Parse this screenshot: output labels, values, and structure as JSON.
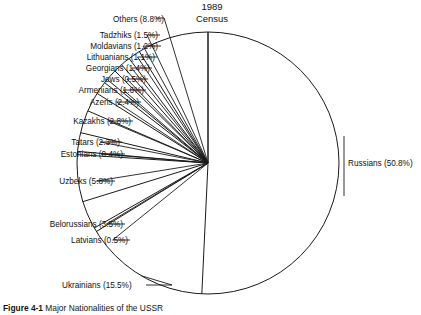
{
  "figure": {
    "title_line1": "1989",
    "title_line2": "Census",
    "caption_number": "Figure 4-1",
    "caption_text": "Major Nationalities of the USSR",
    "background_color": "#ffffff",
    "line_color": "#1a1a1a",
    "text_color": "#111111"
  },
  "labels": {
    "russians": "Russians (50.8%)",
    "ukrainians": "Ukrainians (15.5%)",
    "latvians": "Latvians (0.5%)",
    "belorussians": "Belorussians (3.5%)",
    "uzbeks": "Uzbeks (5.8%)",
    "estonians": "Estonians (0.4%)",
    "tatars": "Tatars (2.3%)",
    "kazakhs": "Kazakhs (2.8%)",
    "azeris": "Azeris (2.4%)",
    "armenians": "Armenians (1.6%)",
    "jews": "Jews (0.5%)",
    "georgians": "Georgians (1.4%)",
    "lithuanians": "Lithuanians (1.1%)",
    "moldavians": "Moldavians (1.2%)",
    "tadzhiks": "Tadzhiks (1.5%)",
    "others": "Others (8.8%)"
  },
  "chart_data": {
    "type": "pie",
    "subtitle": "",
    "xlabel": "",
    "ylabel": "",
    "units": "percent",
    "start_angle_deg": 0,
    "direction": "clockwise",
    "legend": "none",
    "grid": false,
    "labels_show_percent": true,
    "categories": [
      "Russians",
      "Ukrainians",
      "Latvians",
      "Belorussians",
      "Uzbeks",
      "Estonians",
      "Tatars",
      "Kazakhs",
      "Azeris",
      "Armenians",
      "Jews",
      "Georgians",
      "Lithuanians",
      "Moldavians",
      "Tadzhiks",
      "Others"
    ],
    "values": [
      50.8,
      15.5,
      0.5,
      3.5,
      5.8,
      0.4,
      2.3,
      2.8,
      2.4,
      1.6,
      0.5,
      1.4,
      1.1,
      1.2,
      1.5,
      8.8
    ],
    "slices": [
      {
        "name": "Russians",
        "value": 50.8,
        "label": "Russians (50.8%)"
      },
      {
        "name": "Ukrainians",
        "value": 15.5,
        "label": "Ukrainians (15.5%)"
      },
      {
        "name": "Latvians",
        "value": 0.5,
        "label": "Latvians (0.5%)"
      },
      {
        "name": "Belorussians",
        "value": 3.5,
        "label": "Belorussians (3.5%)"
      },
      {
        "name": "Uzbeks",
        "value": 5.8,
        "label": "Uzbeks (5.8%)"
      },
      {
        "name": "Estonians",
        "value": 0.4,
        "label": "Estonians (0.4%)"
      },
      {
        "name": "Tatars",
        "value": 2.3,
        "label": "Tatars (2.3%)"
      },
      {
        "name": "Kazakhs",
        "value": 2.8,
        "label": "Kazakhs (2.8%)"
      },
      {
        "name": "Azeris",
        "value": 2.4,
        "label": "Azeris (2.4%)"
      },
      {
        "name": "Armenians",
        "value": 1.6,
        "label": "Armenians (1.6%)"
      },
      {
        "name": "Jews",
        "value": 0.5,
        "label": "Jews (0.5%)"
      },
      {
        "name": "Georgians",
        "value": 1.4,
        "label": "Georgians (1.4%)"
      },
      {
        "name": "Lithuanians",
        "value": 1.1,
        "label": "Lithuanians (1.1%)"
      },
      {
        "name": "Moldavians",
        "value": 1.2,
        "label": "Moldavians (1.2%)"
      },
      {
        "name": "Tadzhiks",
        "value": 1.5,
        "label": "Tadzhiks (1.5%)"
      },
      {
        "name": "Others",
        "value": 8.8,
        "label": "Others (8.8%)"
      }
    ],
    "total": 100.1
  }
}
